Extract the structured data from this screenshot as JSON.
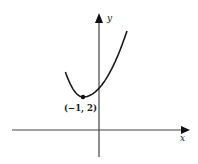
{
  "chart_data": {
    "type": "line",
    "title": "",
    "xlabel": "x",
    "ylabel": "y",
    "grid": false,
    "legend": null,
    "series": [
      {
        "name": "parabola",
        "description": "Upward-opening parabola with vertex at (-1, 2)",
        "vertex": {
          "x": -1,
          "y": 2
        },
        "x": [
          -2.9,
          -2.5,
          -2,
          -1.5,
          -1,
          -0.5,
          0,
          0.5,
          1,
          1.5,
          2.1
        ],
        "y": [
          5.6,
          4.25,
          3,
          2.25,
          2,
          2.25,
          3,
          4.25,
          6,
          8.25,
          11.6
        ]
      }
    ],
    "annotations": [
      {
        "text": "(−1, 2)",
        "x": -1,
        "y": 2,
        "marker": "point"
      }
    ],
    "axes": {
      "x_arrow": true,
      "y_arrow": true,
      "tick_labels": false
    }
  },
  "labels": {
    "x_axis": "x",
    "y_axis": "y",
    "vertex": "(−1, 2)"
  },
  "colors": {
    "ink": "#1a1a1a",
    "axis": "#444444",
    "background": "#ffffff"
  }
}
